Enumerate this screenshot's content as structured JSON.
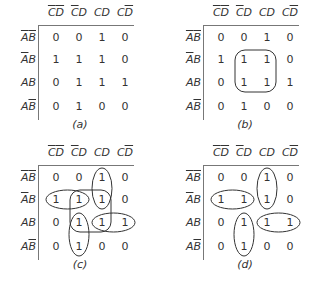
{
  "columns": [
    {
      "parts": [
        {
          "t": "C",
          "bar": true
        },
        {
          "t": "D",
          "bar": true
        }
      ]
    },
    {
      "parts": [
        {
          "t": "C",
          "bar": true
        },
        {
          "t": "D",
          "bar": false
        }
      ]
    },
    {
      "parts": [
        {
          "t": "C",
          "bar": false
        },
        {
          "t": "D",
          "bar": false
        }
      ]
    },
    {
      "parts": [
        {
          "t": "C",
          "bar": false
        },
        {
          "t": "D",
          "bar": true
        }
      ]
    }
  ],
  "rows": [
    {
      "parts": [
        {
          "t": "A",
          "bar": true
        },
        {
          "t": "B",
          "bar": true
        }
      ]
    },
    {
      "parts": [
        {
          "t": "A",
          "bar": true
        },
        {
          "t": "B",
          "bar": false
        }
      ]
    },
    {
      "parts": [
        {
          "t": "A",
          "bar": false
        },
        {
          "t": "B",
          "bar": false
        }
      ]
    },
    {
      "parts": [
        {
          "t": "A",
          "bar": false
        },
        {
          "t": "B",
          "bar": true
        }
      ]
    }
  ],
  "values": [
    [
      "0",
      "0",
      "1",
      "0"
    ],
    [
      "1",
      "1",
      "1",
      "0"
    ],
    [
      "0",
      "1",
      "1",
      "1"
    ],
    [
      "0",
      "1",
      "0",
      "0"
    ]
  ],
  "maps": [
    {
      "id": "a",
      "caption": "(a)",
      "x": 0,
      "y": 0,
      "loops": []
    },
    {
      "id": "b",
      "caption": "(b)",
      "x": 165,
      "y": 0,
      "loops": [
        {
          "type": "rect",
          "r0": 1,
          "c0": 1,
          "r1": 2,
          "c1": 2
        }
      ]
    },
    {
      "id": "c",
      "caption": "(c)",
      "x": 0,
      "y": 140,
      "loops": [
        {
          "type": "ellipse",
          "r0": 0,
          "c0": 2,
          "r1": 1,
          "c1": 2
        },
        {
          "type": "ellipse",
          "r0": 1,
          "c0": 0,
          "r1": 1,
          "c1": 1
        },
        {
          "type": "ellipse",
          "r0": 2,
          "c0": 1,
          "r1": 3,
          "c1": 1
        },
        {
          "type": "ellipse",
          "r0": 2,
          "c0": 2,
          "r1": 2,
          "c1": 3
        },
        {
          "type": "rect",
          "r0": 1,
          "c0": 1,
          "r1": 2,
          "c1": 2
        }
      ]
    },
    {
      "id": "d",
      "caption": "(d)",
      "x": 165,
      "y": 140,
      "loops": [
        {
          "type": "ellipse",
          "r0": 0,
          "c0": 2,
          "r1": 1,
          "c1": 2
        },
        {
          "type": "ellipse",
          "r0": 1,
          "c0": 0,
          "r1": 1,
          "c1": 1
        },
        {
          "type": "ellipse",
          "r0": 2,
          "c0": 1,
          "r1": 3,
          "c1": 1
        },
        {
          "type": "ellipse",
          "r0": 2,
          "c0": 2,
          "r1": 2,
          "c1": 3
        }
      ]
    }
  ]
}
